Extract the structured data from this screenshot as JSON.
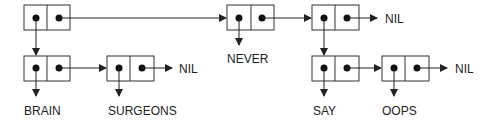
{
  "diagram": {
    "type": "cons-cell-list-structure",
    "cells": [
      {
        "id": "c1",
        "x": 24,
        "y": 5,
        "car": "c2",
        "cdr": "c4"
      },
      {
        "id": "c2",
        "x": 24,
        "y": 56,
        "car": "BRAIN",
        "cdr": "c3"
      },
      {
        "id": "c3",
        "x": 107,
        "y": 56,
        "car": "SURGEONS",
        "cdr": "NIL"
      },
      {
        "id": "c4",
        "x": 227,
        "y": 5,
        "car": "NEVER",
        "cdr": "c5"
      },
      {
        "id": "c5",
        "x": 312,
        "y": 5,
        "car": "c6",
        "cdr": "NIL"
      },
      {
        "id": "c6",
        "x": 312,
        "y": 56,
        "car": "SAY",
        "cdr": "c7"
      },
      {
        "id": "c7",
        "x": 382,
        "y": 56,
        "car": "OOPS",
        "cdr": "NIL"
      }
    ],
    "labels": {
      "brain": "BRAIN",
      "surgeons": "SURGEONS",
      "never": "NEVER",
      "say": "SAY",
      "oops": "OOPS",
      "nil1": "NIL",
      "nil2": "NIL",
      "nil3": "NIL"
    },
    "colors": {
      "stroke": "#333333",
      "dot": "#111111",
      "text": "#222222"
    }
  }
}
